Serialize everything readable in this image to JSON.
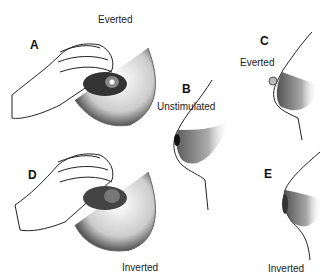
{
  "figure": {
    "panels": [
      {
        "id": "A",
        "letter": "A",
        "caption": "Everted",
        "description": "Hand compressing breast; nipple everted"
      },
      {
        "id": "B",
        "letter": "B",
        "caption": "Unstimulated",
        "description": "Side profile of unstimulated nipple"
      },
      {
        "id": "C",
        "letter": "C",
        "caption": "Everted",
        "description": "Side profile of everted nipple"
      },
      {
        "id": "D",
        "letter": "D",
        "caption": "Inverted",
        "description": "Hand compressing breast; nipple inverted"
      },
      {
        "id": "E",
        "letter": "E",
        "caption": "Inverted",
        "description": "Side profile of inverted nipple"
      }
    ],
    "colors": {
      "ink": "#111111",
      "shade": "#555555",
      "background": "#ffffff"
    }
  }
}
